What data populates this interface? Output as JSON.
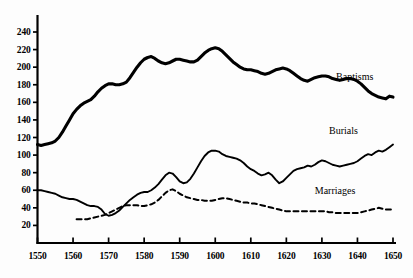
{
  "chart_data": {
    "type": "line",
    "title": "",
    "subtitle": "",
    "xlabel": "",
    "ylabel": "",
    "xlim": [
      1550,
      1650
    ],
    "ylim": [
      0,
      250
    ],
    "grid": false,
    "legend_position": "inline-right",
    "x_ticks": [
      1550,
      1560,
      1570,
      1580,
      1590,
      1600,
      1610,
      1620,
      1630,
      1640,
      1650
    ],
    "y_ticks": [
      20,
      40,
      60,
      80,
      100,
      120,
      140,
      160,
      180,
      200,
      220,
      240
    ],
    "series": [
      {
        "name": "Baptisms",
        "style": "solid",
        "color": "#000000",
        "width": 3.1,
        "label_x": 1634,
        "label_y": 190,
        "x": [
          1550,
          1551,
          1552,
          1553,
          1554,
          1555,
          1556,
          1557,
          1558,
          1559,
          1560,
          1561,
          1562,
          1563,
          1564,
          1565,
          1566,
          1567,
          1568,
          1569,
          1570,
          1571,
          1572,
          1573,
          1574,
          1575,
          1576,
          1577,
          1578,
          1579,
          1580,
          1581,
          1582,
          1583,
          1584,
          1585,
          1586,
          1587,
          1588,
          1589,
          1590,
          1591,
          1592,
          1593,
          1594,
          1595,
          1596,
          1597,
          1598,
          1599,
          1600,
          1601,
          1602,
          1603,
          1604,
          1605,
          1606,
          1607,
          1608,
          1609,
          1610,
          1611,
          1612,
          1613,
          1614,
          1615,
          1616,
          1617,
          1618,
          1619,
          1620,
          1621,
          1622,
          1623,
          1624,
          1625,
          1626,
          1627,
          1628,
          1629,
          1630,
          1631,
          1632,
          1633,
          1634,
          1635,
          1636,
          1637,
          1638,
          1639,
          1640,
          1641,
          1642,
          1643,
          1644,
          1645,
          1646,
          1647,
          1648,
          1649,
          1650
        ],
        "values": [
          112,
          111,
          112,
          113,
          114,
          116,
          120,
          126,
          133,
          140,
          147,
          152,
          156,
          159,
          161,
          163,
          167,
          172,
          176,
          179,
          181,
          181,
          180,
          180,
          181,
          183,
          188,
          194,
          200,
          205,
          209,
          211,
          212,
          210,
          207,
          205,
          204,
          205,
          207,
          209,
          209,
          208,
          207,
          206,
          206,
          208,
          212,
          216,
          219,
          221,
          222,
          221,
          218,
          214,
          210,
          206,
          203,
          200,
          198,
          197,
          197,
          196,
          195,
          193,
          192,
          193,
          195,
          197,
          198,
          199,
          198,
          196,
          193,
          190,
          187,
          185,
          184,
          186,
          188,
          189,
          190,
          190,
          189,
          187,
          186,
          185,
          186,
          187,
          187,
          186,
          184,
          181,
          177,
          173,
          170,
          168,
          166,
          165,
          164,
          167,
          166
        ]
      },
      {
        "name": "Burials",
        "style": "solid",
        "color": "#000000",
        "width": 1.9,
        "label_x": 1632,
        "label_y": 128,
        "x": [
          1550,
          1551,
          1552,
          1553,
          1554,
          1555,
          1556,
          1557,
          1558,
          1559,
          1560,
          1561,
          1562,
          1563,
          1564,
          1565,
          1566,
          1567,
          1568,
          1569,
          1570,
          1571,
          1572,
          1573,
          1574,
          1575,
          1576,
          1577,
          1578,
          1579,
          1580,
          1581,
          1582,
          1583,
          1584,
          1585,
          1586,
          1587,
          1588,
          1589,
          1590,
          1591,
          1592,
          1593,
          1594,
          1595,
          1596,
          1597,
          1598,
          1599,
          1600,
          1601,
          1602,
          1603,
          1604,
          1605,
          1606,
          1607,
          1608,
          1609,
          1610,
          1611,
          1612,
          1613,
          1614,
          1615,
          1616,
          1617,
          1618,
          1619,
          1620,
          1621,
          1622,
          1623,
          1624,
          1625,
          1626,
          1627,
          1628,
          1629,
          1630,
          1631,
          1632,
          1633,
          1634,
          1635,
          1636,
          1637,
          1638,
          1639,
          1640,
          1641,
          1642,
          1643,
          1644,
          1645,
          1646,
          1647,
          1648,
          1649,
          1650
        ],
        "values": [
          60,
          60,
          59,
          58,
          57,
          56,
          54,
          52,
          51,
          50,
          50,
          49,
          47,
          45,
          43,
          42,
          42,
          41,
          38,
          33,
          31,
          32,
          34,
          37,
          41,
          45,
          49,
          52,
          55,
          57,
          58,
          58,
          60,
          63,
          67,
          72,
          77,
          80,
          79,
          75,
          70,
          68,
          69,
          73,
          79,
          86,
          93,
          99,
          103,
          105,
          105,
          104,
          101,
          99,
          98,
          97,
          96,
          94,
          91,
          87,
          84,
          82,
          79,
          77,
          78,
          80,
          77,
          72,
          68,
          70,
          74,
          78,
          82,
          84,
          85,
          86,
          88,
          87,
          89,
          92,
          94,
          93,
          91,
          89,
          88,
          87,
          88,
          89,
          90,
          91,
          93,
          96,
          99,
          101,
          100,
          103,
          105,
          104,
          106,
          109,
          112
        ]
      },
      {
        "name": "Marriages",
        "style": "dashed",
        "color": "#000000",
        "width": 2.0,
        "dash": "5,3.5",
        "label_x": 1628,
        "label_y": 60,
        "x": [
          1561,
          1562,
          1563,
          1564,
          1565,
          1566,
          1567,
          1568,
          1569,
          1570,
          1571,
          1572,
          1573,
          1574,
          1575,
          1576,
          1577,
          1578,
          1579,
          1580,
          1581,
          1582,
          1583,
          1584,
          1585,
          1586,
          1587,
          1588,
          1589,
          1590,
          1591,
          1592,
          1593,
          1594,
          1595,
          1596,
          1597,
          1598,
          1599,
          1600,
          1601,
          1602,
          1603,
          1604,
          1605,
          1606,
          1607,
          1608,
          1609,
          1610,
          1611,
          1612,
          1613,
          1614,
          1615,
          1616,
          1617,
          1618,
          1619,
          1620,
          1621,
          1622,
          1623,
          1624,
          1625,
          1626,
          1627,
          1628,
          1629,
          1630,
          1631,
          1632,
          1633,
          1634,
          1635,
          1636,
          1637,
          1638,
          1639,
          1640,
          1641,
          1642,
          1643,
          1644,
          1645,
          1646,
          1647,
          1648,
          1649,
          1650
        ],
        "values": [
          27,
          27,
          27,
          27,
          28,
          29,
          30,
          31,
          32,
          34,
          36,
          38,
          40,
          42,
          43,
          43,
          43,
          43,
          42,
          42,
          43,
          44,
          46,
          49,
          53,
          57,
          60,
          61,
          59,
          56,
          54,
          52,
          51,
          50,
          49,
          49,
          48,
          48,
          48,
          49,
          50,
          51,
          51,
          50,
          49,
          48,
          47,
          46,
          46,
          45,
          45,
          44,
          43,
          42,
          41,
          40,
          39,
          38,
          37,
          36,
          36,
          36,
          36,
          36,
          36,
          36,
          36,
          36,
          36,
          36,
          36,
          35,
          35,
          34,
          34,
          34,
          34,
          34,
          34,
          34,
          35,
          36,
          37,
          38,
          39,
          40,
          39,
          38,
          38,
          38
        ]
      }
    ]
  },
  "axes": {
    "y_tick_labels": [
      "240",
      "220",
      "200",
      "180",
      "160",
      "140",
      "120",
      "100",
      "80",
      "60",
      "40",
      "20"
    ],
    "x_tick_labels": [
      "1550",
      "1560",
      "1570",
      "1580",
      "1590",
      "1600",
      "1610",
      "1620",
      "1630",
      "1640",
      "1650"
    ]
  },
  "labels": {
    "baptisms": "Baptisms",
    "burials": "Burials",
    "marriages": "Marriages"
  }
}
